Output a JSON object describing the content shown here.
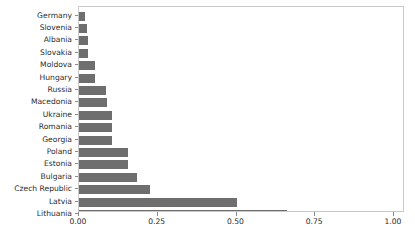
{
  "chart_data": {
    "type": "bar",
    "orientation": "horizontal",
    "title": "",
    "subtitle": "",
    "xlabel": "",
    "ylabel": "",
    "xlim": [
      0.0,
      1.0
    ],
    "ylim": null,
    "grid": false,
    "legend": null,
    "legend_position": "none",
    "bar_color": "#6e6e6e",
    "frame_color": "#c9c9c9",
    "background": "#ffffff",
    "x_ticks": [
      0.0,
      0.25,
      0.5,
      0.75,
      1.0
    ],
    "x_tick_labels": [
      "0.00",
      "0.25",
      "0.50",
      "0.75",
      "1.00"
    ],
    "categories": [
      "Germany",
      "Slovenia",
      "Albania",
      "Slovakia",
      "Moldova",
      "Hungary",
      "Russia",
      "Macedonia",
      "Ukraine",
      "Romania",
      "Georgia",
      "Poland",
      "Estonia",
      "Bulgaria",
      "Czech Republic",
      "Latvia",
      "Lithuania"
    ],
    "values": [
      0.02,
      0.025,
      0.03,
      0.03,
      0.05,
      0.05,
      0.085,
      0.09,
      0.105,
      0.105,
      0.105,
      0.155,
      0.155,
      0.185,
      0.225,
      0.5,
      0.66
    ]
  },
  "axis": {
    "x_tick_labels": [
      "0.00",
      "0.25",
      "0.50",
      "0.75",
      "1.00"
    ]
  }
}
